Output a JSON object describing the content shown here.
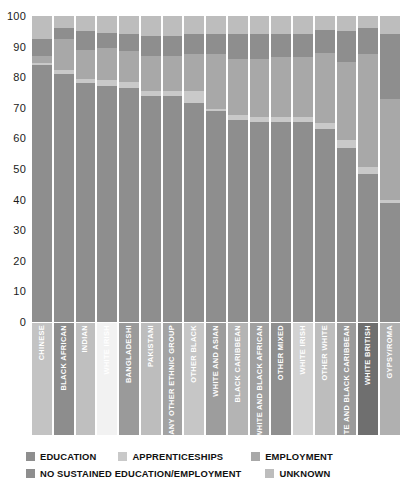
{
  "chart": {
    "y_axis_title": "PER CENT",
    "y_ticks": [
      "100",
      "90",
      "80",
      "70",
      "60",
      "50",
      "40",
      "30",
      "20",
      "10",
      "0"
    ]
  },
  "legend": {
    "items": [
      {
        "label": "EDUCATION",
        "color": "#8e8e8e"
      },
      {
        "label": "APPRENTICESHIPS",
        "color": "#c9c9c9"
      },
      {
        "label": "EMPLOYMENT",
        "color": "#a8a8a8"
      },
      {
        "label": "NO SUSTAINED EDUCATION/EMPLOYMENT",
        "color": "#8e8e8e"
      },
      {
        "label": "UNKNOWN",
        "color": "#bdbdbd"
      }
    ]
  },
  "chart_data": {
    "type": "bar",
    "stacked": true,
    "title": "",
    "xlabel": "",
    "ylabel": "PER CENT",
    "ylim": [
      0,
      100
    ],
    "ytick_step": 10,
    "grid": false,
    "legend_position": "bottom",
    "orientation": "vertical",
    "categories": [
      "CHINESE",
      "BLACK AFRICAN",
      "INDIAN",
      "WHITE IRISH",
      "BANGLADESHI",
      "PAKISTANI",
      "ANY OTHER ETHNIC GROUP",
      "OTHER BLACK",
      "WHITE AND ASIAN",
      "BLACK CARIBBEAN",
      "WHITE AND BLACK AFRICAN",
      "OTHER MIXED",
      "WHITE IRISH",
      "OTHER WHITE",
      "WHITE AND BLACK CARIBBEAN",
      "WHITE BRITISH",
      "GYPSY/ROMA"
    ],
    "series": [
      {
        "name": "EDUCATION",
        "color": "#8e8e8e",
        "values": [
          84,
          81,
          78,
          77,
          76.5,
          74,
          74,
          71.5,
          69,
          66,
          65.5,
          65.5,
          65.5,
          63,
          57,
          48.5,
          39
        ]
      },
      {
        "name": "APPRENTICESHIPS",
        "color": "#c9c9c9",
        "values": [
          0.5,
          1.5,
          1.5,
          2,
          2,
          1.5,
          1.5,
          4,
          0.5,
          1.5,
          1.5,
          1.5,
          1.5,
          2,
          2.5,
          2,
          1
        ]
      },
      {
        "name": "EMPLOYMENT",
        "color": "#a8a8a8",
        "values": [
          2.5,
          10,
          9.5,
          10.5,
          10,
          11.5,
          11.5,
          12,
          18,
          18.5,
          19,
          19.5,
          19.5,
          23,
          25.5,
          37,
          33
        ]
      },
      {
        "name": "NO SUSTAINED EDUCATION/EMPLOYMENT",
        "color": "#8e8e8e",
        "values": [
          5.5,
          3.5,
          6,
          5,
          5.5,
          6.5,
          6.5,
          6.5,
          6.5,
          8,
          8,
          7.5,
          7.5,
          7.5,
          10,
          8.5,
          21
        ]
      },
      {
        "name": "UNKNOWN",
        "color": "#bdbdbd",
        "values": [
          7.5,
          4,
          5,
          5.5,
          6,
          6.5,
          6.5,
          6,
          6,
          6,
          6,
          6,
          6,
          4.5,
          5,
          4,
          6
        ]
      }
    ],
    "label_text_color": "#ffffff",
    "category_label_backgrounds": [
      "#c3c3c3",
      "#8d8d8d",
      "#bfbfbf",
      "#f2f2f2",
      "#9a9a9a",
      "#bdbdbd",
      "#a3a3a3",
      "#c6c6c6",
      "#9d9d9d",
      "#b4b4b4",
      "#a0a0a0",
      "#8f8f8f",
      "#d3d3d3",
      "#bdbdbd",
      "#9b9b9b",
      "#6f6f6f",
      "#b0b0b0"
    ]
  }
}
